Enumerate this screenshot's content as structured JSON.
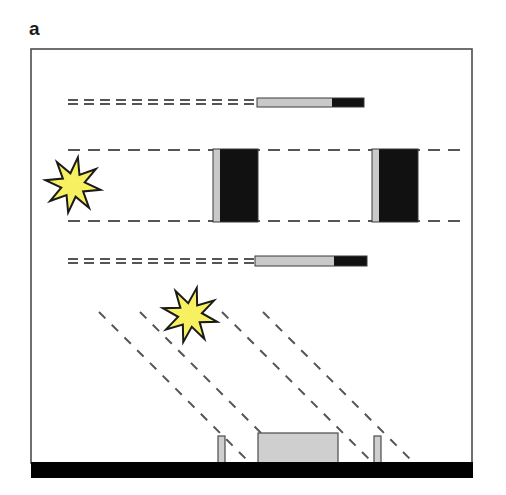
{
  "figure": {
    "panel_label": "a",
    "type": "schematic-diagram",
    "colors": {
      "background": "#ffffff",
      "frame_stroke": "#4d4d4d",
      "dash_stroke": "#555555",
      "star_fill": "#f7f060",
      "star_stroke": "#1a1a1a",
      "bar_gray": "#c9c9c9",
      "bar_black": "#111111",
      "ground_black": "#000000",
      "block_gray": "#cfcfcf",
      "label_color": "#1a1a1a"
    },
    "frame": {
      "x": 31,
      "y": 49,
      "width": 441,
      "height": 414,
      "stroke_width": 1.6
    },
    "stars": [
      {
        "name": "light-source-upper",
        "cx": 73,
        "cy": 185,
        "outer_r": 28,
        "inner_r": 12,
        "points": 8,
        "rotation": 10
      },
      {
        "name": "light-source-lower",
        "cx": 190,
        "cy": 315,
        "outer_r": 28,
        "inner_r": 12,
        "points": 8,
        "rotation": 14
      }
    ],
    "horizontal_ray_rows": [
      {
        "name": "ray-row-top",
        "double_line": true,
        "y_upper": 100,
        "y_lower": 104,
        "x_start": 68,
        "x_end": 256,
        "dash": "10 6",
        "bar": {
          "x": 257,
          "y": 98,
          "width": 107,
          "height": 9,
          "gray_width": 75,
          "black_width": 32
        }
      },
      {
        "name": "ray-row-bottom",
        "double_line": true,
        "y_upper": 259,
        "y_lower": 263,
        "x_start": 68,
        "x_end": 254,
        "dash": "10 6",
        "bar": {
          "x": 255,
          "y": 256,
          "width": 112,
          "height": 10,
          "gray_width": 79,
          "black_width": 33
        }
      }
    ],
    "middle_channel": {
      "name": "ray-channel-middle",
      "y_top": 150,
      "y_bottom": 221,
      "x_start": 68,
      "x_end": 466,
      "dash": "12 8",
      "vertical_bars": [
        {
          "name": "shutter-bar-left",
          "x": 213,
          "y": 149,
          "width": 45,
          "height": 73,
          "gray_width": 7
        },
        {
          "name": "shutter-bar-right",
          "x": 372,
          "y": 149,
          "width": 46,
          "height": 73,
          "gray_width": 7
        }
      ]
    },
    "oblique_rays": {
      "name": "oblique-ray-group",
      "count": 4,
      "dash": "9 9",
      "angle_note": "down-right, slope ~1.0",
      "lines": [
        {
          "x1": 99,
          "y1": 312,
          "x2": 252,
          "y2": 465
        },
        {
          "x1": 140,
          "y1": 312,
          "x2": 293,
          "y2": 465
        },
        {
          "x1": 222,
          "y1": 312,
          "x2": 375,
          "y2": 465
        },
        {
          "x1": 263,
          "y1": 312,
          "x2": 416,
          "y2": 465
        }
      ]
    },
    "ground": {
      "name": "ground-bar",
      "x": 31,
      "y": 462,
      "width": 442,
      "height": 16
    },
    "ground_objects": [
      {
        "name": "post-left",
        "x": 218,
        "y": 436,
        "width": 7,
        "height": 27
      },
      {
        "name": "block-center",
        "x": 258,
        "y": 433,
        "width": 80,
        "height": 30
      },
      {
        "name": "post-right",
        "x": 374,
        "y": 436,
        "width": 7,
        "height": 27
      }
    ]
  }
}
